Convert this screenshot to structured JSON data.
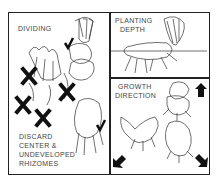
{
  "panels": {
    "dividing": {
      "title": "DIVIDING",
      "note_lines": [
        "DISCARD",
        "CENTER &",
        "UNDEVELOPED",
        "RHIZOMES"
      ]
    },
    "planting_depth": {
      "title_lines": [
        "PLANTING",
        "DEPTH"
      ]
    },
    "growth_direction": {
      "title_lines": [
        "GROWTH",
        "DIRECTION"
      ]
    }
  },
  "marks": {
    "cross_count": 4,
    "check_count": 2,
    "arrow_count": 3
  },
  "colors": {
    "ink": "#222222",
    "paper": "#ffffff",
    "text": "#444444"
  }
}
